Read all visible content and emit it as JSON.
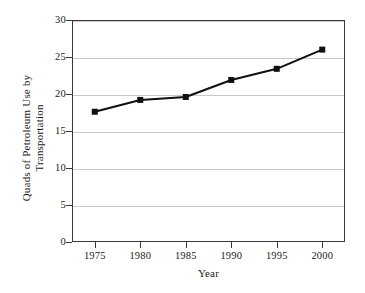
{
  "chart_data": {
    "type": "line",
    "title": "",
    "xlabel": "Year",
    "ylabel": "Quads of Petroleum Use by\nTransportation",
    "ylabel_line1": "Quads of Petroleum Use by",
    "ylabel_line2": "Transportation",
    "x": [
      1975,
      1980,
      1985,
      1990,
      1995,
      2000
    ],
    "categories": [
      "1975",
      "1980",
      "1985",
      "1990",
      "1995",
      "2000"
    ],
    "values": [
      17.6,
      19.2,
      19.6,
      21.9,
      23.4,
      26.0
    ],
    "series": [
      {
        "name": "Quads of Petroleum Use by Transportation",
        "values": [
          17.6,
          19.2,
          19.6,
          21.9,
          23.4,
          26.0
        ]
      }
    ],
    "xlim": [
      1972.5,
      2002.5
    ],
    "ylim": [
      0,
      30
    ],
    "yticks": [
      0,
      5,
      10,
      15,
      20,
      25,
      30
    ],
    "ytick_labels": [
      "0",
      "5",
      "10",
      "15",
      "20",
      "25",
      "30"
    ],
    "xticks": [
      1975,
      1980,
      1985,
      1990,
      1995,
      2000
    ],
    "xtick_labels": [
      "1975",
      "1980",
      "1985",
      "1990",
      "1995",
      "2000"
    ],
    "grid": "horizontal",
    "legend": "none",
    "marker": "square",
    "line_color": "#101010",
    "marker_color": "#101010",
    "grid_color": "#c9c9c9",
    "axis_color": "#3a3a3a",
    "background_color": "#ffffff"
  }
}
